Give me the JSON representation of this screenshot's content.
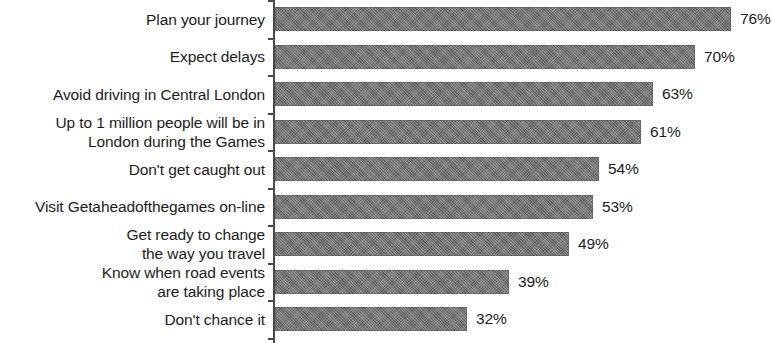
{
  "chart_data": {
    "type": "bar",
    "orientation": "horizontal",
    "title": "",
    "subtitle": "",
    "xlabel": "",
    "ylabel": "",
    "xlim": [
      0,
      76
    ],
    "grid": false,
    "legend": null,
    "value_suffix": "%",
    "categories": [
      "Plan your journey",
      "Expect delays",
      "Avoid driving in Central London",
      "Up to 1 million people will be in London during the Games",
      "Don't get caught out",
      "Visit Getaheadofthegames on-line",
      "Get ready to change the way you travel",
      "Know when road events are taking place",
      "Don't chance it"
    ],
    "category_lines": [
      [
        "Plan your journey"
      ],
      [
        "Expect delays"
      ],
      [
        "Avoid driving in Central London"
      ],
      [
        "Up to 1 million people will be in",
        "London during the Games"
      ],
      [
        "Don't get caught out"
      ],
      [
        "Visit Getaheadofthegames on-line"
      ],
      [
        "Get ready to change",
        "the way you travel"
      ],
      [
        "Know when road events",
        "are taking place"
      ],
      [
        "Don't chance it"
      ]
    ],
    "values": [
      76,
      70,
      63,
      61,
      54,
      53,
      49,
      39,
      32
    ],
    "data_labels": [
      "76%",
      "70%",
      "63%",
      "61%",
      "54%",
      "53%",
      "49%",
      "39%",
      "32%"
    ],
    "colors": {
      "bar": "#707070",
      "axis": "#4a4a4a",
      "text": "#1c1c1c",
      "background": "#ffffff"
    }
  }
}
